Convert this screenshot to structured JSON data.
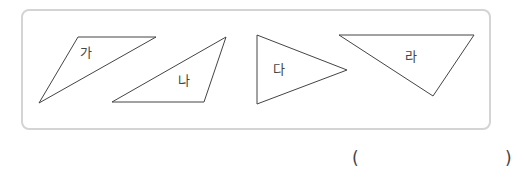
{
  "figure": {
    "stroke_color": "#444444",
    "box_border_color": "#d4d4d4",
    "triangles": [
      {
        "label": "가",
        "points": "78,37 156,37 39,103",
        "label_pos": [
          80,
          46
        ]
      },
      {
        "label": "나",
        "points": "226,37 204,102 112,102",
        "label_pos": [
          178,
          74
        ]
      },
      {
        "label": "다",
        "points": "257,35 257,104 347,70",
        "label_pos": [
          273,
          63
        ]
      },
      {
        "label": "라",
        "points": "339,35 474,35 433,96",
        "label_pos": [
          405,
          50
        ]
      }
    ]
  },
  "answer": {
    "open_paren": "(",
    "close_paren": ")",
    "value": ""
  }
}
